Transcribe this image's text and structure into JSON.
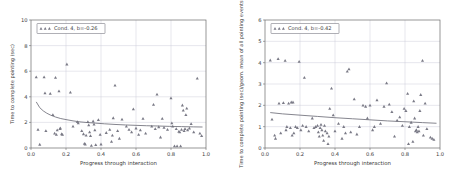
{
  "figure": {
    "background": "#ffffff",
    "marker_color": "#55555f",
    "fit_color": "#6f6f7a",
    "grid_color": "#c9c9d6"
  },
  "chart_data": [
    {
      "type": "scatter",
      "panel": "left",
      "title": "",
      "xlabel": "Progress through interaction",
      "ylabel": "Time to complete pointing (sec)",
      "xlim": [
        0.0,
        1.0
      ],
      "ylim": [
        0,
        10
      ],
      "xticks": [
        "0.0",
        "0.2",
        "0.4",
        "0.6",
        "0.8",
        "1.0"
      ],
      "xtick_values": [
        0.0,
        0.2,
        0.4,
        0.6,
        0.8,
        1.0
      ],
      "yticks": [
        "0",
        "2",
        "4",
        "6",
        "8",
        "10"
      ],
      "ytick_values": [
        0,
        2,
        4,
        6,
        8,
        10
      ],
      "grid": true,
      "legend": {
        "position": "upper left",
        "marker": "triangle",
        "label": "Cond. 4, b=-0.26"
      },
      "annotations": [
        "b=-0.26"
      ],
      "fit": {
        "kind": "power",
        "equation": "y = a * x^b",
        "b": -0.26,
        "points": [
          [
            0.03,
            3.6
          ],
          [
            0.05,
            3.15
          ],
          [
            0.07,
            2.9
          ],
          [
            0.09,
            2.72
          ],
          [
            0.11,
            2.58
          ],
          [
            0.14,
            2.42
          ],
          [
            0.17,
            2.3
          ],
          [
            0.2,
            2.22
          ],
          [
            0.24,
            2.12
          ],
          [
            0.28,
            2.04
          ],
          [
            0.32,
            1.99
          ],
          [
            0.37,
            1.94
          ],
          [
            0.42,
            1.89
          ],
          [
            0.48,
            1.84
          ],
          [
            0.54,
            1.8
          ],
          [
            0.6,
            1.77
          ],
          [
            0.66,
            1.74
          ],
          [
            0.72,
            1.72
          ],
          [
            0.79,
            1.69
          ],
          [
            0.86,
            1.67
          ],
          [
            0.93,
            1.65
          ],
          [
            0.98,
            1.64
          ]
        ]
      },
      "points": [
        [
          0.03,
          5.55
        ],
        [
          0.04,
          1.45
        ],
        [
          0.05,
          0.28
        ],
        [
          0.075,
          5.55
        ],
        [
          0.08,
          4.3
        ],
        [
          0.085,
          1.35
        ],
        [
          0.11,
          4.25
        ],
        [
          0.125,
          2.6
        ],
        [
          0.135,
          1.15
        ],
        [
          0.14,
          5.5
        ],
        [
          0.145,
          1.05
        ],
        [
          0.15,
          1.4
        ],
        [
          0.16,
          4.45
        ],
        [
          0.165,
          1.5
        ],
        [
          0.168,
          1.55
        ],
        [
          0.175,
          1.1
        ],
        [
          0.18,
          1.05
        ],
        [
          0.205,
          6.55
        ],
        [
          0.225,
          4.35
        ],
        [
          0.24,
          1.7
        ],
        [
          0.265,
          2.05
        ],
        [
          0.27,
          1.95
        ],
        [
          0.29,
          1.35
        ],
        [
          0.3,
          1.1
        ],
        [
          0.305,
          0.35
        ],
        [
          0.31,
          0.3
        ],
        [
          0.315,
          1.0
        ],
        [
          0.325,
          2.05
        ],
        [
          0.33,
          1.8
        ],
        [
          0.335,
          1.25
        ],
        [
          0.34,
          0.95
        ],
        [
          0.345,
          0.2
        ],
        [
          0.355,
          2.1
        ],
        [
          0.36,
          1.85
        ],
        [
          0.365,
          1.4
        ],
        [
          0.37,
          0.25
        ],
        [
          0.385,
          2.2
        ],
        [
          0.395,
          1.05
        ],
        [
          0.4,
          0.3
        ],
        [
          0.43,
          1.2
        ],
        [
          0.45,
          1.45
        ],
        [
          0.46,
          0.5
        ],
        [
          0.465,
          1.0
        ],
        [
          0.47,
          2.35
        ],
        [
          0.48,
          4.9
        ],
        [
          0.495,
          1.35
        ],
        [
          0.505,
          0.75
        ],
        [
          0.52,
          2.25
        ],
        [
          0.545,
          1.7
        ],
        [
          0.56,
          1.45
        ],
        [
          0.575,
          1.25
        ],
        [
          0.585,
          3.05
        ],
        [
          0.6,
          1.55
        ],
        [
          0.615,
          1.05
        ],
        [
          0.625,
          1.4
        ],
        [
          0.64,
          2.3
        ],
        [
          0.655,
          1.15
        ],
        [
          0.69,
          1.7
        ],
        [
          0.7,
          3.4
        ],
        [
          0.71,
          1.5
        ],
        [
          0.72,
          4.2
        ],
        [
          0.73,
          1.65
        ],
        [
          0.74,
          0.85
        ],
        [
          0.75,
          2.3
        ],
        [
          0.76,
          1.6
        ],
        [
          0.78,
          1.45
        ],
        [
          0.8,
          3.9
        ],
        [
          0.805,
          1.95
        ],
        [
          0.81,
          1.7
        ],
        [
          0.82,
          0.15
        ],
        [
          0.83,
          1.5
        ],
        [
          0.835,
          0.15
        ],
        [
          0.845,
          1.3
        ],
        [
          0.85,
          1.25
        ],
        [
          0.855,
          0.15
        ],
        [
          0.86,
          1.45
        ],
        [
          0.865,
          3.35
        ],
        [
          0.87,
          2.95
        ],
        [
          0.875,
          1.35
        ],
        [
          0.88,
          1.5
        ],
        [
          0.885,
          2.6
        ],
        [
          0.89,
          3.1
        ],
        [
          0.895,
          1.4
        ],
        [
          0.905,
          1.55
        ],
        [
          0.915,
          1.9
        ],
        [
          0.93,
          1.25
        ],
        [
          0.95,
          5.45
        ],
        [
          0.965,
          1.15
        ],
        [
          0.975,
          0.95
        ]
      ]
    },
    {
      "type": "scatter",
      "panel": "right",
      "title": "",
      "xlabel": "Progress through interaction",
      "ylabel": "Time to complete pointing (sec)/geom. mean of all pointing events",
      "xlim": [
        0.0,
        1.0
      ],
      "ylim": [
        0,
        6
      ],
      "xticks": [
        "0.0",
        "0.2",
        "0.4",
        "0.6",
        "0.8",
        "1.0"
      ],
      "xtick_values": [
        0.0,
        0.2,
        0.4,
        0.6,
        0.8,
        1.0
      ],
      "yticks": [
        "0",
        "1",
        "2",
        "3",
        "4",
        "5",
        "6"
      ],
      "ytick_values": [
        0,
        1,
        2,
        3,
        4,
        5,
        6
      ],
      "grid": true,
      "legend": {
        "position": "upper left",
        "marker": "triangle",
        "label": "Cond. 4, b=-0.42"
      },
      "annotations": [
        "b=-0.42"
      ],
      "fit": {
        "kind": "power",
        "equation": "y = a * x^b",
        "b": -0.42,
        "points": [
          [
            0.03,
            1.66
          ],
          [
            0.1,
            1.6
          ],
          [
            0.2,
            1.54
          ],
          [
            0.3,
            1.48
          ],
          [
            0.4,
            1.42
          ],
          [
            0.5,
            1.37
          ],
          [
            0.6,
            1.32
          ],
          [
            0.7,
            1.27
          ],
          [
            0.8,
            1.23
          ],
          [
            0.9,
            1.19
          ],
          [
            0.98,
            1.16
          ]
        ]
      },
      "points": [
        [
          0.03,
          4.12
        ],
        [
          0.04,
          1.35
        ],
        [
          0.055,
          0.6
        ],
        [
          0.06,
          0.45
        ],
        [
          0.075,
          4.18
        ],
        [
          0.08,
          2.1
        ],
        [
          0.09,
          0.7
        ],
        [
          0.105,
          2.12
        ],
        [
          0.115,
          4.1
        ],
        [
          0.12,
          0.85
        ],
        [
          0.125,
          1.0
        ],
        [
          0.135,
          2.1
        ],
        [
          0.145,
          0.95
        ],
        [
          0.15,
          2.15
        ],
        [
          0.155,
          0.6
        ],
        [
          0.16,
          2.15
        ],
        [
          0.165,
          0.7
        ],
        [
          0.175,
          1.0
        ],
        [
          0.185,
          0.95
        ],
        [
          0.195,
          4.05
        ],
        [
          0.205,
          0.85
        ],
        [
          0.215,
          1.05
        ],
        [
          0.225,
          3.3
        ],
        [
          0.235,
          1.0
        ],
        [
          0.25,
          0.8
        ],
        [
          0.27,
          1.4
        ],
        [
          0.28,
          0.95
        ],
        [
          0.29,
          1.0
        ],
        [
          0.3,
          1.05
        ],
        [
          0.305,
          0.75
        ],
        [
          0.31,
          0.55
        ],
        [
          0.315,
          0.95
        ],
        [
          0.32,
          1.1
        ],
        [
          0.325,
          0.85
        ],
        [
          0.33,
          0.6
        ],
        [
          0.335,
          0.35
        ],
        [
          0.34,
          1.05
        ],
        [
          0.345,
          0.8
        ],
        [
          0.355,
          0.7
        ],
        [
          0.36,
          0.2
        ],
        [
          0.365,
          0.55
        ],
        [
          0.37,
          1.85
        ],
        [
          0.38,
          2.8
        ],
        [
          0.39,
          1.55
        ],
        [
          0.4,
          0.8
        ],
        [
          0.42,
          1.15
        ],
        [
          0.44,
          0.45
        ],
        [
          0.45,
          1.0
        ],
        [
          0.46,
          0.7
        ],
        [
          0.47,
          3.6
        ],
        [
          0.48,
          3.7
        ],
        [
          0.49,
          0.75
        ],
        [
          0.51,
          2.3
        ],
        [
          0.525,
          0.65
        ],
        [
          0.54,
          1.0
        ],
        [
          0.56,
          2.0
        ],
        [
          0.575,
          1.95
        ],
        [
          0.585,
          1.4
        ],
        [
          0.6,
          2.0
        ],
        [
          0.615,
          0.85
        ],
        [
          0.625,
          1.0
        ],
        [
          0.64,
          2.25
        ],
        [
          0.66,
          1.15
        ],
        [
          0.68,
          1.95
        ],
        [
          0.695,
          3.05
        ],
        [
          0.71,
          2.05
        ],
        [
          0.725,
          1.7
        ],
        [
          0.74,
          0.55
        ],
        [
          0.755,
          1.3
        ],
        [
          0.77,
          1.45
        ],
        [
          0.785,
          1.05
        ],
        [
          0.795,
          1.85
        ],
        [
          0.805,
          1.75
        ],
        [
          0.815,
          2.55
        ],
        [
          0.82,
          0.2
        ],
        [
          0.825,
          1.0
        ],
        [
          0.835,
          1.2
        ],
        [
          0.845,
          0.3
        ],
        [
          0.85,
          2.2
        ],
        [
          0.855,
          1.4
        ],
        [
          0.86,
          0.8
        ],
        [
          0.865,
          0.85
        ],
        [
          0.87,
          0.75
        ],
        [
          0.875,
          1.0
        ],
        [
          0.88,
          0.8
        ],
        [
          0.885,
          1.75
        ],
        [
          0.89,
          2.5
        ],
        [
          0.9,
          4.1
        ],
        [
          0.905,
          0.6
        ],
        [
          0.915,
          2.1
        ],
        [
          0.925,
          0.9
        ],
        [
          0.945,
          0.5
        ],
        [
          0.955,
          0.45
        ],
        [
          0.965,
          0.4
        ]
      ]
    }
  ]
}
